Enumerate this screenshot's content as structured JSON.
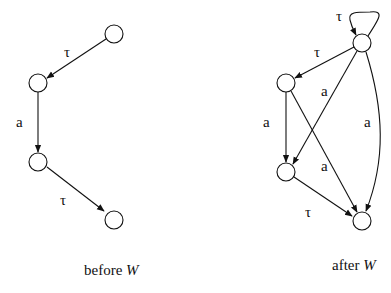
{
  "diagrams": [
    {
      "id": "before",
      "caption": "before ",
      "caption_var": "W",
      "nodes": [
        {
          "id": "s0",
          "x": 114,
          "y": 34
        },
        {
          "id": "s1",
          "x": 38,
          "y": 83
        },
        {
          "id": "s2",
          "x": 38,
          "y": 162
        },
        {
          "id": "s3",
          "x": 114,
          "y": 220
        }
      ],
      "edges": [
        {
          "from": "s0",
          "to": "s1",
          "label": "τ"
        },
        {
          "from": "s1",
          "to": "s2",
          "label": "a"
        },
        {
          "from": "s2",
          "to": "s3",
          "label": "τ"
        }
      ]
    },
    {
      "id": "after",
      "caption": "after ",
      "caption_var": "W",
      "nodes": [
        {
          "id": "t0",
          "x": 362,
          "y": 43
        },
        {
          "id": "t1",
          "x": 286,
          "y": 83
        },
        {
          "id": "t2",
          "x": 286,
          "y": 172
        },
        {
          "id": "t3",
          "x": 362,
          "y": 221
        }
      ],
      "edges": [
        {
          "from": "t0",
          "to": "t0",
          "label": "τ"
        },
        {
          "from": "t0",
          "to": "t1",
          "label": "τ"
        },
        {
          "from": "t0",
          "to": "t2",
          "label": "a"
        },
        {
          "from": "t0",
          "to": "t3",
          "label": "a"
        },
        {
          "from": "t1",
          "to": "t2",
          "label": "a"
        },
        {
          "from": "t1",
          "to": "t3",
          "label": "a"
        },
        {
          "from": "t2",
          "to": "t3",
          "label": "τ"
        }
      ]
    }
  ],
  "labels": {
    "before_t1": "τ",
    "before_a": "a",
    "before_t2": "τ",
    "after_loop": "τ",
    "after_t1": "τ",
    "after_a_cross": "a",
    "after_a_left": "a",
    "after_a_right": "a",
    "after_a_lower": "a",
    "after_t2": "τ",
    "before_caption": "before ",
    "after_caption": "after ",
    "caption_var": "W"
  }
}
